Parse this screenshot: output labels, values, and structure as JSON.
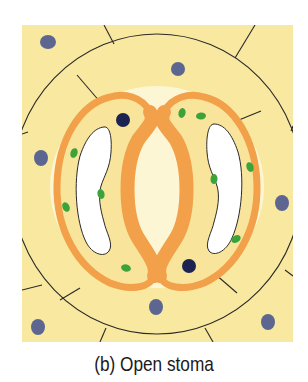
{
  "figure": {
    "caption": "(b) Open stoma",
    "colors": {
      "background": "#ffffff",
      "epidermal_cell": "#f8e8a0",
      "cell_halo": "#fdf6d4",
      "guard_cell_wall": "#f2a04a",
      "guard_cell_cytoplasm": "#f8e49a",
      "vacuole": "#ffffff",
      "chloroplast": "#3aa33a",
      "guard_cell_nucleus": "#1c2350",
      "epidermal_nucleus": "#5c6690",
      "cell_wall_line": "#2a2a2a"
    },
    "parts": [
      {
        "name": "epidermal-cells"
      },
      {
        "name": "subsidiary-cells"
      },
      {
        "name": "guard-cell-left"
      },
      {
        "name": "guard-cell-right"
      },
      {
        "name": "stomatal-pore",
        "state": "open"
      }
    ]
  }
}
